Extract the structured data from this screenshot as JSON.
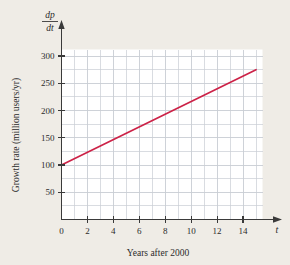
{
  "figure": {
    "background_color": "#efece6",
    "plot_background_color": "#ffffff",
    "grid_color": "#c9cdd4",
    "axis_color": "#3a3a3a",
    "line_color": "#cc2247"
  },
  "labels": {
    "y_axis_title": "Growth rate (million users/yr)",
    "x_axis_title": "Years after 2000",
    "x_variable": "t",
    "y_variable_numerator": "dp",
    "y_variable_denominator": "dt"
  },
  "chart_data": {
    "type": "line",
    "title": "",
    "xlabel": "Years after 2000",
    "ylabel": "Growth rate (million users/yr)",
    "xlim": [
      0,
      15.5
    ],
    "ylim": [
      0,
      312
    ],
    "xticks": [
      0,
      2,
      4,
      6,
      8,
      10,
      12,
      14
    ],
    "xtick_labels": [
      "0",
      "2",
      "4",
      "6",
      "8",
      "10",
      "12",
      "14"
    ],
    "yticks": [
      50,
      100,
      150,
      200,
      250,
      300
    ],
    "ytick_labels": [
      "50",
      "100",
      "150",
      "200",
      "250",
      "300"
    ],
    "grid": true,
    "grid_x_step": 1,
    "grid_y_step": 25,
    "legend": false,
    "series": [
      {
        "name": "dp/dt",
        "color": "#cc2247",
        "x": [
          0,
          15
        ],
        "y": [
          100,
          275
        ],
        "slope": 11.67,
        "intercept": 100
      }
    ]
  }
}
